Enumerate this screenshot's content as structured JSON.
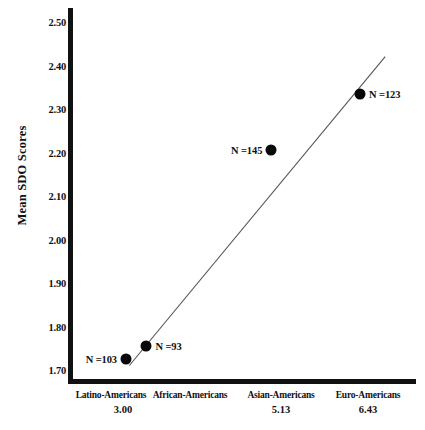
{
  "chart_data": {
    "type": "scatter",
    "title": "",
    "xlabel": "",
    "ylabel": "Mean SDO Scores",
    "ylim": [
      1.7,
      2.55
    ],
    "grid": false,
    "legend": null,
    "categories": [
      "Latino-Americans",
      "African-Americans",
      "Asian-Americans",
      "Euro-Americans"
    ],
    "category_values": [
      "3.00",
      "",
      "5.13",
      "6.43"
    ],
    "yticks": [
      "2.50",
      "2.40",
      "2.30",
      "2.20",
      "2.10",
      "2.00",
      "1.90",
      "1.80",
      "1.70"
    ],
    "ytick_values": [
      2.5,
      2.4,
      2.3,
      2.2,
      2.1,
      2.0,
      1.9,
      1.8,
      1.7
    ],
    "points": [
      {
        "category": "Latino-Americans",
        "x": 3.0,
        "y": 1.73,
        "label": "N =103",
        "label_side": "left"
      },
      {
        "category": "African-Americans",
        "x": 3.3,
        "y": 1.76,
        "label": "N =93",
        "label_side": "right"
      },
      {
        "category": "Asian-Americans",
        "x": 5.13,
        "y": 2.21,
        "label": "N =145",
        "label_side": "left"
      },
      {
        "category": "Euro-Americans",
        "x": 6.43,
        "y": 2.34,
        "label": "N =123",
        "label_side": "right"
      }
    ],
    "trendline": {
      "x0": 3.05,
      "y0": 1.715,
      "x1": 6.8,
      "y1": 2.425
    },
    "colors": {
      "axis": "#111111",
      "marker": "#080808",
      "trendline": "#555555",
      "background": "#ffffff"
    }
  }
}
